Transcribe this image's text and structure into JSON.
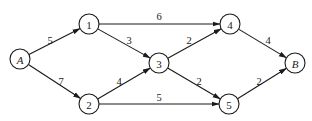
{
  "diagram": {
    "type": "directed-weighted-network",
    "nodes": [
      {
        "id": "A",
        "label": "A",
        "italic": true,
        "x": 20,
        "y": 59
      },
      {
        "id": "1",
        "label": "1",
        "italic": false,
        "x": 89,
        "y": 24
      },
      {
        "id": "2",
        "label": "2",
        "italic": false,
        "x": 89,
        "y": 104
      },
      {
        "id": "3",
        "label": "3",
        "italic": false,
        "x": 159,
        "y": 63
      },
      {
        "id": "4",
        "label": "4",
        "italic": false,
        "x": 230,
        "y": 24
      },
      {
        "id": "5",
        "label": "5",
        "italic": false,
        "x": 229,
        "y": 104
      },
      {
        "id": "B",
        "label": "B",
        "italic": true,
        "x": 295,
        "y": 63
      }
    ],
    "edges": [
      {
        "from": "A",
        "to": "1",
        "weight": "5",
        "label_x": 50,
        "label_y": 40
      },
      {
        "from": "A",
        "to": "2",
        "weight": "7",
        "label_x": 61,
        "label_y": 81
      },
      {
        "from": "1",
        "to": "4",
        "weight": "6",
        "label_x": 159,
        "label_y": 16
      },
      {
        "from": "1",
        "to": "3",
        "weight": "3",
        "label_x": 129,
        "label_y": 40
      },
      {
        "from": "2",
        "to": "3",
        "weight": "4",
        "label_x": 119,
        "label_y": 81
      },
      {
        "from": "2",
        "to": "5",
        "weight": "5",
        "label_x": 159,
        "label_y": 97
      },
      {
        "from": "3",
        "to": "4",
        "weight": "2",
        "label_x": 189,
        "label_y": 40
      },
      {
        "from": "3",
        "to": "5",
        "weight": "2",
        "label_x": 199,
        "label_y": 81
      },
      {
        "from": "4",
        "to": "B",
        "weight": "4",
        "label_x": 268,
        "label_y": 40
      },
      {
        "from": "5",
        "to": "B",
        "weight": "2",
        "label_x": 259,
        "label_y": 81
      }
    ],
    "node_radius": 10,
    "colors": {
      "stroke": "#1a1a1a",
      "background": "#ffffff"
    }
  }
}
